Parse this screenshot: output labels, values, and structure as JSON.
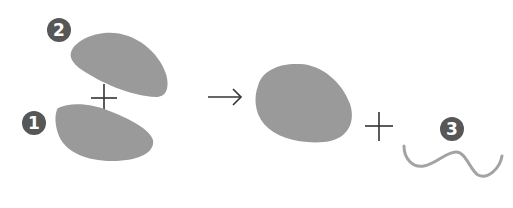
{
  "diagram": {
    "colors": {
      "blob_fill": "#9a9a9a",
      "badge_fill": "#575757",
      "badge_text": "#ffffff",
      "line_stroke": "#a3a3a3",
      "symbol_stroke": "#333333"
    },
    "labels": {
      "subunit_1": "1",
      "subunit_2": "2",
      "byproduct": "3"
    },
    "symbols": {
      "plus_left": "+",
      "arrow": "→",
      "plus_right": "+"
    }
  }
}
